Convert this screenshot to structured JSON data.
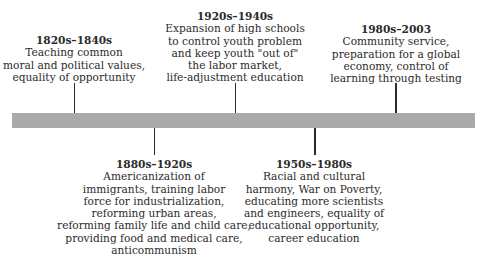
{
  "diagram": {
    "type": "timeline",
    "bar_color": "#a9a9a9",
    "line_color": "#2b2b2b",
    "events": [
      {
        "period": "1820s–1840s",
        "position": "above",
        "lines": [
          "Teaching common",
          "moral and political values,",
          "equality of opportunity"
        ]
      },
      {
        "period": "1880s–1920s",
        "position": "below",
        "lines": [
          "Americanization of",
          "immigrants, training labor",
          "force for industrialization,",
          "reforming urban areas,",
          "reforming family life and child care,",
          "providing food and medical care,",
          "anticommunism"
        ]
      },
      {
        "period": "1920s–1940s",
        "position": "above",
        "lines": [
          "Expansion of high schools",
          "to control youth problem",
          "and keep youth \"out of\"",
          "the labor market,",
          "life-adjustment education"
        ]
      },
      {
        "period": "1950s–1980s",
        "position": "below",
        "lines": [
          "Racial and cultural",
          "harmony, War on Poverty,",
          "educating more scientists",
          "and engineers, equality of",
          "educational opportunity,",
          "career education"
        ]
      },
      {
        "period": "1980s–2003",
        "position": "above",
        "lines": [
          "Community service,",
          "preparation for a global",
          "economy, control of",
          "learning through testing"
        ]
      }
    ]
  }
}
